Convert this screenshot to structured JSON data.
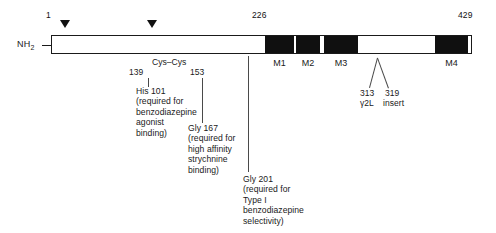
{
  "diagram": {
    "title_terminus": "NH₂",
    "top_positions": [
      {
        "label": "1",
        "x": 46,
        "y": 10
      },
      {
        "label": "226",
        "x": 252,
        "y": 10
      },
      {
        "label": "429",
        "x": 458,
        "y": 10
      }
    ],
    "glycosylation_markers": [
      {
        "name": "glyc-site-1",
        "x": 60,
        "y": 20
      },
      {
        "name": "glyc-site-2",
        "x": 147,
        "y": 20
      }
    ],
    "transmembrane_domains": [
      {
        "label": "M1",
        "left": 265,
        "width": 29
      },
      {
        "label": "M2",
        "left": 296,
        "width": 24
      },
      {
        "label": "M3",
        "left": 324,
        "width": 34
      },
      {
        "label": "M4",
        "left": 435,
        "width": 33
      }
    ],
    "disulfide": {
      "left_position": "139",
      "right_position": "153",
      "bond_label": "Cys–Cys"
    },
    "annotations": [
      {
        "name": "his101",
        "text": "His 101\n(required for\nbenzodiazepine\nagonist\nbinding)",
        "x": 136,
        "y": 86
      },
      {
        "name": "gly167",
        "text": "Gly 167\n(required for\nhigh affinity\nstrychnine\nbinding)",
        "x": 188,
        "y": 123
      },
      {
        "name": "gly201",
        "text": "Gly 201\n(required for\nType I\nbenzodiazepine\nselectivity)",
        "x": 243,
        "y": 174
      }
    ],
    "gamma2l_insert": {
      "position_left": "313",
      "position_right": "319",
      "label_left": "γ2L",
      "label_right": "insert"
    }
  }
}
